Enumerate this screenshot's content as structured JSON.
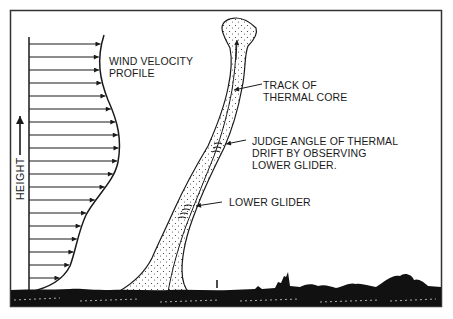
{
  "diagram": {
    "labels": {
      "wind_profile_line1": "WIND VELOCITY",
      "wind_profile_line2": "PROFILE",
      "height_axis": "HEIGHT",
      "track_line1": "TRACK OF",
      "track_line2": "THERMAL CORE",
      "judge_line1": "JUDGE ANGLE OF THERMAL",
      "judge_line2": "DRIFT BY OBSERVING",
      "judge_line3": "LOWER GLIDER.",
      "lower_glider": "LOWER GLIDER"
    },
    "wind_profile": {
      "arrow_count": 19,
      "description": "Horizontal wind arrows increasing in length with height, bulging mid-height"
    },
    "colors": {
      "ink": "#1a1a1a",
      "frame": "#333333",
      "background": "#ffffff"
    }
  }
}
